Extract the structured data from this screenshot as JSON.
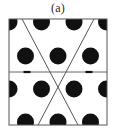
{
  "figure": {
    "panel_label": "(a)",
    "caption_position": "top-center",
    "background_color": "#ffffff"
  },
  "diagram": {
    "type": "crystal-lattice-unit-cell",
    "cell": {
      "x": 9,
      "y": 19,
      "width": 98,
      "height": 106,
      "border_color": "#555555",
      "border_width": 1,
      "fill_color": "#ffffff"
    },
    "atoms": {
      "fill_color": "#111111",
      "radius": 8.5,
      "rows": [
        {
          "row_index": 0,
          "cy": 22,
          "cx_list": [
            9,
            41.5,
            74,
            106.5
          ]
        },
        {
          "row_index": 1,
          "cy": 56,
          "cx_list": [
            25.5,
            58,
            90.5
          ]
        },
        {
          "row_index": 2,
          "cy": 89,
          "cx_list": [
            9,
            41.5,
            74,
            106.5
          ]
        },
        {
          "row_index": 3,
          "cy": 122,
          "cx_list": [
            25.5,
            58,
            90.5
          ]
        }
      ]
    },
    "horizontal_line": {
      "label": "lattice-vector-horizontal",
      "x1": 9,
      "y1": 72,
      "x2": 107,
      "y2": 72,
      "color": "#666666",
      "width": 1,
      "arrow_markers": [
        {
          "x": 27,
          "y": 72,
          "width": 7,
          "height": 2.2,
          "color": "#111111"
        },
        {
          "x": 89,
          "y": 72,
          "width": 7,
          "height": 2.2,
          "color": "#111111"
        }
      ]
    },
    "diagonals": [
      {
        "label": "diagonal-left-down",
        "x1": 22,
        "y1": 19,
        "x2": 78,
        "y2": 125,
        "color": "#555555",
        "width": 1
      },
      {
        "label": "diagonal-right-down",
        "x1": 94,
        "y1": 19,
        "x2": 38,
        "y2": 125,
        "color": "#555555",
        "width": 1
      }
    ],
    "crossing_point": {
      "x": 58,
      "y": 72
    }
  }
}
